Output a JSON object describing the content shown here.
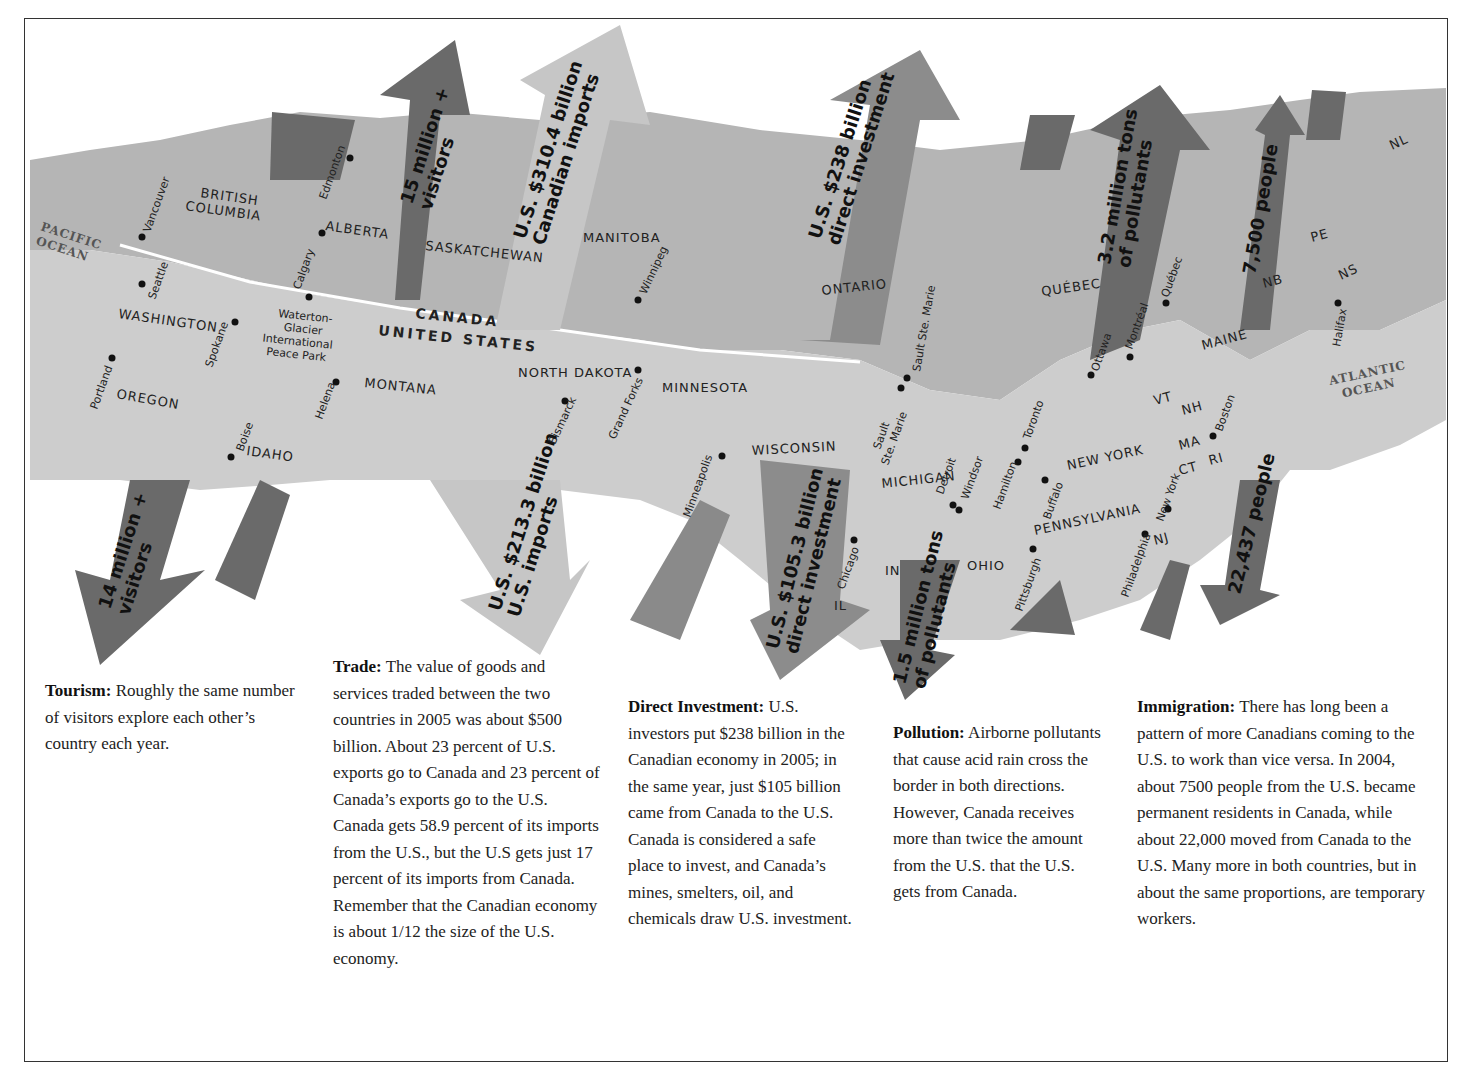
{
  "map": {
    "countries": {
      "canada": "CANADA",
      "us": "UNITED STATES"
    },
    "oceans": {
      "pacific": [
        "PACIFIC",
        "OCEAN"
      ],
      "atlantic": [
        "ATLANTIC",
        "OCEAN"
      ]
    },
    "regions": {
      "bc": [
        "BRITISH",
        "COLUMBIA"
      ],
      "alberta": "ALBERTA",
      "saskatchewan": "SASKATCHEWAN",
      "manitoba": "MANITOBA",
      "ontario": "ONTARIO",
      "quebec": "QUÉBEC",
      "nb": "NB",
      "pe": "PE",
      "ns": "NS",
      "nl": "NL",
      "washington": "WASHINGTON",
      "oregon": "OREGON",
      "idaho": "IDAHO",
      "montana": "MONTANA",
      "north_dakota": "NORTH DAKOTA",
      "minnesota": "MINNESOTA",
      "wisconsin": "WISCONSIN",
      "michigan": "MICHIGAN",
      "il": "IL",
      "in": "IN",
      "ohio": "OHIO",
      "pennsylvania": "PENNSYLVANIA",
      "new_york": "NEW YORK",
      "nj": "NJ",
      "vt": "VT",
      "nh": "NH",
      "ma": "MA",
      "ct": "CT",
      "ri": "RI",
      "maine": "MAINE"
    },
    "cities": {
      "vancouver": "Vancouver",
      "seattle": "Seattle",
      "edmonton": "Edmonton",
      "calgary": "Calgary",
      "spokane": "Spokane",
      "portland": "Portland",
      "boise": "Boise",
      "helena": "Helena",
      "waterton": [
        "Waterton-",
        "Glacier",
        "International",
        "Peace Park"
      ],
      "winnipeg": "Winnipeg",
      "bismarck": "Bismarck",
      "grand_forks": "Grand Forks",
      "minneapolis": "Minneapolis",
      "chicago": "Chicago",
      "sault_ca": "Sault Ste. Marie",
      "sault_us": [
        "Sault",
        "Ste. Marie"
      ],
      "detroit": "Detroit",
      "windsor": "Windsor",
      "hamilton": "Hamilton",
      "toronto": "Toronto",
      "buffalo": "Buffalo",
      "pittsburgh": "Pittsburgh",
      "philadelphia": "Philadelphia",
      "new_york_city": "New York",
      "boston": "Boston",
      "ottawa": "Ottawa",
      "montreal": "Montréal",
      "quebec_city": "Québec",
      "halifax": "Halifax"
    },
    "arrows": {
      "tourism_north": [
        "15 million +",
        "visitors"
      ],
      "tourism_south": [
        "14 million +",
        "visitors"
      ],
      "trade_north": [
        "U.S. $310.4 billion",
        "Canadian imports"
      ],
      "trade_south": [
        "U.S. $213.3 billion",
        "U.S. imports"
      ],
      "invest_north": [
        "U.S. $238 billion",
        "direct investment"
      ],
      "invest_south": [
        "U.S. $105.3 billion",
        "direct investment"
      ],
      "pollution_north": [
        "3.2 million tons",
        "of pollutants"
      ],
      "pollution_south": [
        "1.5 million tons",
        "of pollutants"
      ],
      "immig_north": [
        "7,500 people"
      ],
      "immig_south": [
        "22,437 people"
      ]
    },
    "colors": {
      "land_ca": "#b4b4b4",
      "land_us": "#cdcdcd",
      "arrow_dark": "#6a6a6a",
      "arrow_mid": "#8a8a8a",
      "arrow_light": "#c2c2c2",
      "border": "#ffffff"
    }
  },
  "captions": {
    "tourism": {
      "title": "Tourism:",
      "body": " Roughly the same number of visitors explore each other’s country each year."
    },
    "trade": {
      "title": "Trade:",
      "body": " The value of goods and services traded between the two countries in 2005 was about $500 billion. About 23 percent of U.S. exports go to Canada and 23 percent of Canada’s exports go to the U.S. Canada gets 58.9 percent of its imports from the U.S., but the U.S gets just 17 percent of its imports from Canada. Remember that the Canadian economy is about 1/12 the size of the U.S. economy."
    },
    "investment": {
      "title": "Direct Investment:",
      "body": " U.S. investors put $238 billion in the Canadian economy in 2005; in the same year, just $105 billion came from Canada to the U.S. Canada is considered a safe place to invest, and Canada’s mines, smelters, oil, and chemicals draw U.S. investment."
    },
    "pollution": {
      "title": "Pollution:",
      "body": " Airborne pollutants that cause acid rain cross the border in both directions. However, Canada receives more than twice the amount from the U.S. that the U.S. gets from Canada."
    },
    "immigration": {
      "title": "Immigration:",
      "body": " There has long been a pattern of more Canadians coming to the U.S. to work than vice versa.  In 2004, about 7500 people from the U.S. became permanent residents in Canada, while about 22,000 moved from Canada to the U.S.  Many more in both countries, but in about the same proportions, are temporary workers."
    }
  }
}
